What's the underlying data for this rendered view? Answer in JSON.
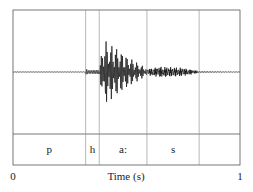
{
  "chart_data": {
    "type": "line",
    "title": "",
    "xlabel": "Time (s)",
    "ylabel": "",
    "xlim": [
      0,
      1
    ],
    "x_ticks": [
      "0",
      "1"
    ],
    "segments": [
      {
        "label": "p",
        "start": 0.0,
        "end": 0.32
      },
      {
        "label": "h",
        "start": 0.32,
        "end": 0.38
      },
      {
        "label": "a:",
        "start": 0.38,
        "end": 0.59
      },
      {
        "label": "s",
        "start": 0.59,
        "end": 0.82
      },
      {
        "label": "",
        "start": 0.82,
        "end": 1.0
      }
    ],
    "waveform_envelope": [
      {
        "t": 0.0,
        "amp": 0.01
      },
      {
        "t": 0.32,
        "amp": 0.01
      },
      {
        "t": 0.322,
        "amp": 0.18
      },
      {
        "t": 0.33,
        "amp": 0.08
      },
      {
        "t": 0.38,
        "amp": 0.1
      },
      {
        "t": 0.4,
        "amp": 0.9
      },
      {
        "t": 0.45,
        "amp": 0.7
      },
      {
        "t": 0.5,
        "amp": 0.45
      },
      {
        "t": 0.55,
        "amp": 0.25
      },
      {
        "t": 0.59,
        "amp": 0.1
      },
      {
        "t": 0.65,
        "amp": 0.17
      },
      {
        "t": 0.74,
        "amp": 0.14
      },
      {
        "t": 0.82,
        "amp": 0.03
      },
      {
        "t": 1.0,
        "amp": 0.01
      }
    ]
  },
  "axis": {
    "x_min_label": "0",
    "x_max_label": "1",
    "xlabel": "Time (s)"
  },
  "segments_labels": [
    "p",
    "h",
    "a:",
    "s"
  ]
}
